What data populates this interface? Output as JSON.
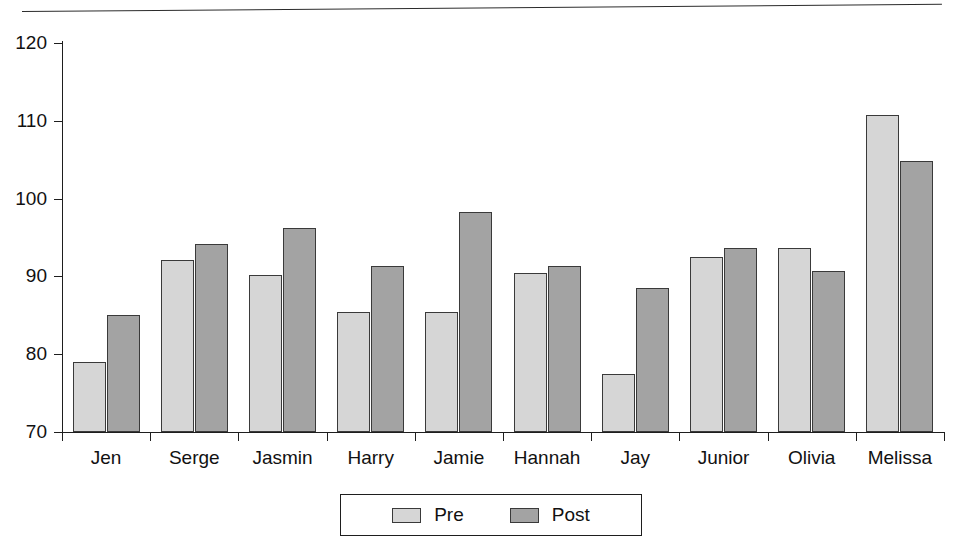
{
  "chart_data": {
    "type": "bar",
    "title": "",
    "subtitle": "",
    "xlabel": "",
    "ylabel": "",
    "ylim": [
      70,
      120
    ],
    "yticks": [
      70,
      80,
      90,
      100,
      110,
      120
    ],
    "grid": false,
    "legend_position": "bottom-center",
    "categories": [
      "Jen",
      "Serge",
      "Jasmin",
      "Harry",
      "Jamie",
      "Hannah",
      "Jay",
      "Junior",
      "Olivia",
      "Melissa"
    ],
    "series": [
      {
        "name": "Pre",
        "color": "#d6d6d6",
        "values": [
          79.0,
          92.1,
          90.2,
          85.4,
          85.4,
          90.4,
          77.5,
          92.5,
          93.6,
          110.8
        ]
      },
      {
        "name": "Post",
        "color": "#a3a3a3",
        "values": [
          85.1,
          94.2,
          96.2,
          91.3,
          98.3,
          91.4,
          88.5,
          93.6,
          90.7,
          104.8
        ]
      }
    ]
  },
  "axes": {
    "y_tick_labels": [
      "120",
      "110",
      "100",
      "90",
      "80",
      "70"
    ]
  },
  "legend": {
    "entries": [
      {
        "label": "Pre",
        "swatch": "pre-swatch-icon"
      },
      {
        "label": "Post",
        "swatch": "post-swatch-icon"
      }
    ]
  },
  "decor": {
    "top_rule": "horizontal-rule"
  }
}
